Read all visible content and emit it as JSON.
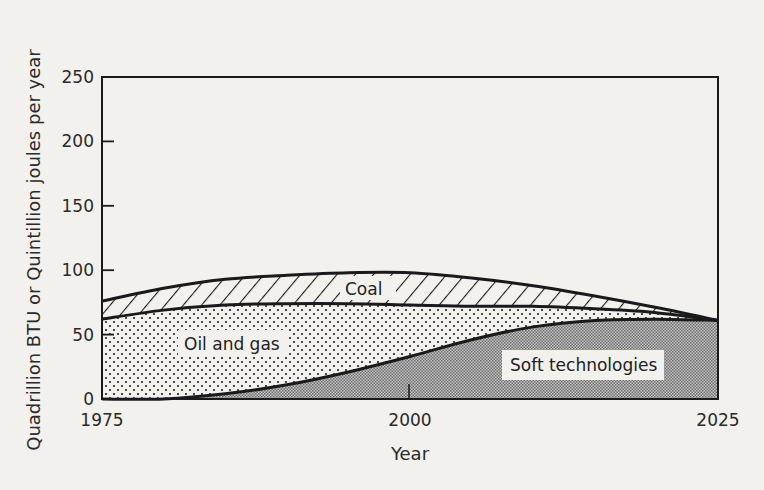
{
  "chart_data": {
    "type": "area",
    "stacked": true,
    "title": "",
    "xlabel": "Year",
    "ylabel": "Quadrillion BTU or Quintillion joules per year",
    "xlim": [
      1975,
      2025
    ],
    "ylim": [
      0,
      250
    ],
    "x_ticks": [
      1975,
      2000,
      2025
    ],
    "y_ticks": [
      0,
      50,
      100,
      150,
      200,
      250
    ],
    "grid": false,
    "legend": "inline labels",
    "x": [
      1975,
      1980,
      1985,
      1990,
      1995,
      2000,
      2005,
      2010,
      2015,
      2020,
      2025
    ],
    "series": [
      {
        "name": "Soft technologies",
        "pattern": "fine-checker-gray",
        "top": [
          0,
          0,
          4,
          11,
          21,
          33,
          46,
          56,
          61,
          62,
          61
        ]
      },
      {
        "name": "Oil and gas",
        "pattern": "sparse-dots",
        "top": [
          62,
          69,
          73,
          74,
          74,
          73,
          72,
          72,
          70,
          67,
          61
        ]
      },
      {
        "name": "Coal",
        "pattern": "diagonal-hatch",
        "top": [
          76,
          86,
          93,
          96,
          98,
          98,
          94,
          88,
          80,
          71,
          61
        ]
      }
    ],
    "annotations": [
      {
        "text": "Coal",
        "x": 1996.5,
        "y": 84
      },
      {
        "text": "Oil and gas",
        "x": 1986.5,
        "y": 45
      },
      {
        "text": "Soft technologies",
        "x": 2012,
        "y": 27
      }
    ]
  },
  "labels": {
    "coal": "Coal",
    "oil_gas": "Oil and gas",
    "soft": "Soft technologies",
    "xlabel": "Year",
    "ylabel": "Quadrillion BTU or Quintillion joules per year"
  },
  "colors": {
    "background": "#f2f1ee",
    "ink": "#1a1a1a",
    "soft_fill": "#9c9c9c",
    "label_box": "#f2f1ee"
  }
}
